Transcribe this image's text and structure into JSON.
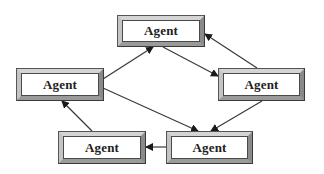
{
  "diagram": {
    "type": "multi-agent network",
    "nodes": [
      {
        "id": "top",
        "label": "Agent",
        "x": 117,
        "y": 15,
        "w": 88,
        "h": 32
      },
      {
        "id": "left",
        "label": "Agent",
        "x": 16,
        "y": 68,
        "w": 88,
        "h": 33
      },
      {
        "id": "right",
        "label": "Agent",
        "x": 218,
        "y": 68,
        "w": 87,
        "h": 33
      },
      {
        "id": "bottom_left",
        "label": "Agent",
        "x": 58,
        "y": 131,
        "w": 88,
        "h": 33
      },
      {
        "id": "bottom_right",
        "label": "Agent",
        "x": 166,
        "y": 131,
        "w": 87,
        "h": 33
      }
    ],
    "edges": [
      {
        "from": "left",
        "to": "top",
        "x1": 103,
        "y1": 79,
        "x2": 153,
        "y2": 47
      },
      {
        "from": "top",
        "to": "right",
        "x1": 163,
        "y1": 47,
        "x2": 218,
        "y2": 76
      },
      {
        "from": "right",
        "to": "top",
        "x1": 257,
        "y1": 68,
        "x2": 205,
        "y2": 34
      },
      {
        "from": "left",
        "to": "bottom_right",
        "x1": 103,
        "y1": 88,
        "x2": 198,
        "y2": 131
      },
      {
        "from": "right",
        "to": "bottom_right",
        "x1": 262,
        "y1": 101,
        "x2": 211,
        "y2": 131
      },
      {
        "from": "bottom_left",
        "to": "left",
        "x1": 92,
        "y1": 131,
        "x2": 62,
        "y2": 101
      },
      {
        "from": "bottom_right",
        "to": "bottom_left",
        "x1": 166,
        "y1": 147,
        "x2": 146,
        "y2": 147
      }
    ],
    "colors": {
      "line": "#3a3a3a",
      "box_border": "#3a3a3a",
      "box_fill": "#ffffff",
      "bevel_light": "#d4d4d4",
      "bevel_dark": "#8a8a8a"
    }
  }
}
